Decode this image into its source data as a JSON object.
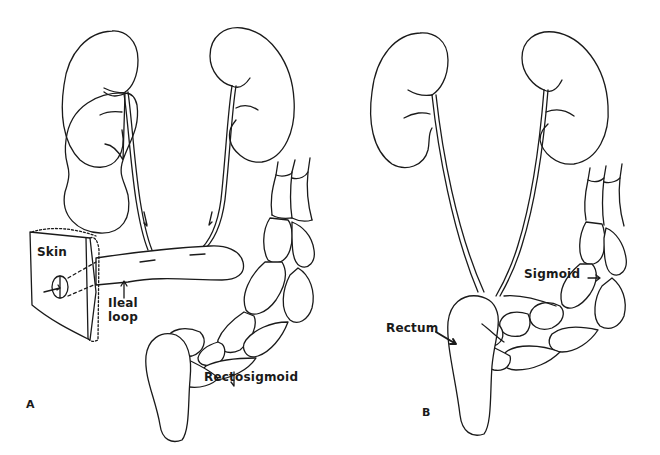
{
  "figure": {
    "panels": [
      {
        "id": "A",
        "letter": "A",
        "labels": {
          "skin": "Skin",
          "ileal_line1": "Ileal",
          "ileal_line2": "loop",
          "rectosigmoid": "Rectosigmoid"
        }
      },
      {
        "id": "B",
        "letter": "B",
        "labels": {
          "sigmoid": "Sigmoid",
          "rectum": "Rectum"
        }
      }
    ],
    "colors": {
      "line": "#1a1a1a",
      "background": "#ffffff"
    }
  }
}
